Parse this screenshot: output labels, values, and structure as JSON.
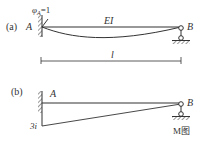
{
  "diagram_a": {
    "panel_label": "(a)",
    "left_node": "A",
    "right_node": "B",
    "rotation_label_phi": "φ",
    "rotation_label_sub": "A",
    "rotation_label_eq": "=1",
    "stiffness_label": "EI",
    "length_label": "l"
  },
  "diagram_b": {
    "panel_label": "(b)",
    "left_node": "A",
    "right_node": "B",
    "moment_value": "3i",
    "caption": "M图"
  },
  "colors": {
    "line": "#333333",
    "background": "#ffffff"
  }
}
